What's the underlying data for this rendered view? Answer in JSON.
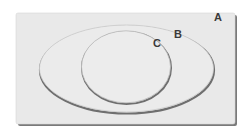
{
  "diagram": {
    "type": "venn-nested",
    "sets": [
      {
        "id": "A",
        "label": "A",
        "shape": "rectangle",
        "contains": [
          "B"
        ]
      },
      {
        "id": "B",
        "label": "B",
        "shape": "ellipse",
        "contains": [
          "C"
        ]
      },
      {
        "id": "C",
        "label": "C",
        "shape": "ellipse",
        "contains": []
      }
    ],
    "colors": {
      "fill": "#e8e8e8",
      "outline": "#9a9a9a",
      "shadow": "#6e6e6e",
      "label": "#3a3a3a"
    }
  }
}
